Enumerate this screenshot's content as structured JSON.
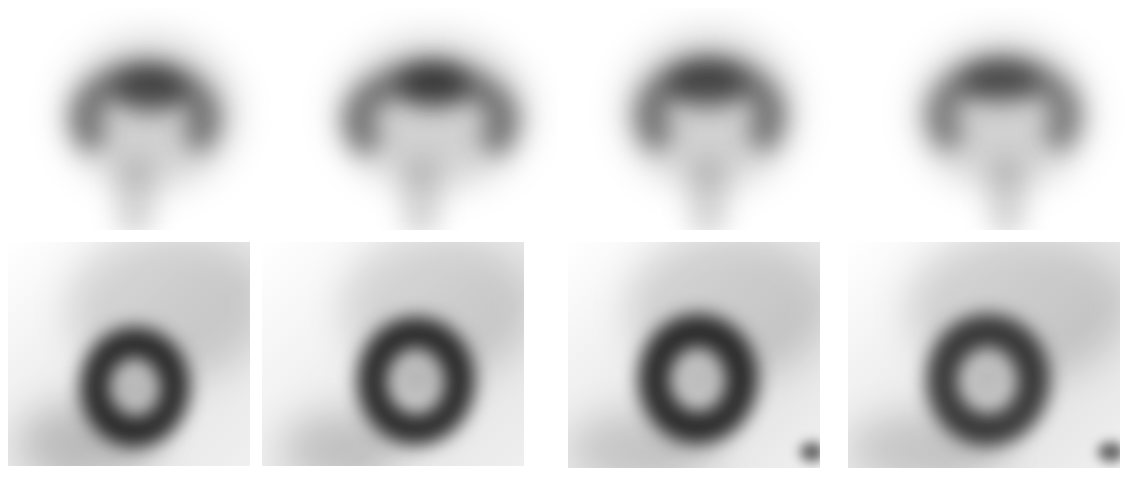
{
  "figure": {
    "layout": {
      "rows": 2,
      "columns": 4
    },
    "background_color": "#ffffff",
    "image_tone": "grayscale",
    "rows": [
      {
        "name": "top-row",
        "view": "horseshoe-shaped tracer uptake (vertical/long-axis slices)",
        "panels": [
          {
            "id": "top-1"
          },
          {
            "id": "top-2"
          },
          {
            "id": "top-3"
          },
          {
            "id": "top-4"
          }
        ]
      },
      {
        "name": "bottom-row",
        "view": "ring-shaped tracer uptake (short-axis slices)",
        "panels": [
          {
            "id": "bottom-1"
          },
          {
            "id": "bottom-2"
          },
          {
            "id": "bottom-3"
          },
          {
            "id": "bottom-4"
          }
        ]
      }
    ]
  }
}
